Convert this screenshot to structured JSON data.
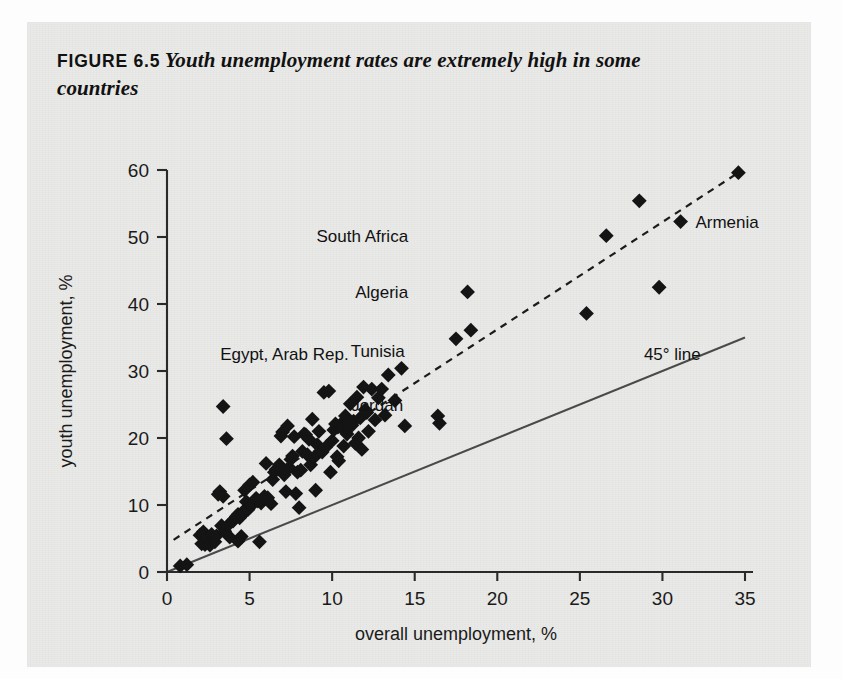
{
  "figure": {
    "tag": "FIGURE 6.5",
    "title": "Youth unemployment rates are extremely high in some countries"
  },
  "chart_data": {
    "type": "scatter",
    "title": "Youth unemployment rates are extremely high in some countries",
    "xlabel": "overall unemployment, %",
    "ylabel": "youth unemployment, %",
    "xlim": [
      0,
      35
    ],
    "ylim": [
      0,
      60
    ],
    "xticks": [
      0,
      5,
      10,
      15,
      20,
      25,
      30,
      35
    ],
    "yticks": [
      0,
      10,
      20,
      30,
      40,
      50,
      60
    ],
    "grid": false,
    "legend": "none",
    "reference_lines": [
      {
        "name": "45-degree-line",
        "label": "45° line",
        "style": "solid",
        "from": [
          0,
          0
        ],
        "to": [
          35,
          35
        ],
        "label_xy": [
          30.6,
          32.5
        ]
      },
      {
        "name": "trend-line",
        "label": "",
        "style": "dashed",
        "from": [
          0.4,
          4.8
        ],
        "to": [
          34.6,
          59.6
        ]
      }
    ],
    "annotations": [
      {
        "text": "South Africa",
        "x": 14.6,
        "y": 50.2,
        "anchor": "end",
        "point": [
          26.6,
          50.2
        ]
      },
      {
        "text": "Armenia",
        "x": 32.0,
        "y": 52.3,
        "anchor": "start",
        "point": [
          31.1,
          52.3
        ]
      },
      {
        "text": "Algeria",
        "x": 14.6,
        "y": 41.8,
        "anchor": "end",
        "point": [
          18.2,
          41.8
        ]
      },
      {
        "text": "Tunisia",
        "x": 14.4,
        "y": 33.0,
        "anchor": "end",
        "point": [
          17.5,
          34.8
        ]
      },
      {
        "text": "Egypt, Arab Rep.",
        "x": 11.0,
        "y": 32.6,
        "anchor": "end",
        "point": [
          9.8,
          27.0
        ]
      },
      {
        "text": "Jordan",
        "x": 14.3,
        "y": 25.0,
        "anchor": "end",
        "point": [
          16.5,
          22.9
        ]
      },
      {
        "text": "45° line",
        "x": 30.6,
        "y": 32.5,
        "anchor": "middle",
        "point": [
          32.5,
          30.0
        ]
      }
    ],
    "points": [
      [
        0.8,
        0.9
      ],
      [
        1.2,
        1.1
      ],
      [
        2.0,
        5.5
      ],
      [
        2.1,
        4.2
      ],
      [
        2.3,
        4.1
      ],
      [
        2.2,
        6.0
      ],
      [
        2.5,
        5.1
      ],
      [
        2.6,
        4.0
      ],
      [
        2.7,
        5.6
      ],
      [
        2.9,
        4.5
      ],
      [
        3.0,
        5.4
      ],
      [
        3.1,
        11.6
      ],
      [
        3.2,
        12.0
      ],
      [
        3.4,
        11.3
      ],
      [
        3.4,
        24.7
      ],
      [
        3.6,
        19.9
      ],
      [
        3.3,
        6.9
      ],
      [
        3.5,
        6.1
      ],
      [
        3.7,
        7.0
      ],
      [
        3.8,
        5.2
      ],
      [
        4.0,
        7.6
      ],
      [
        4.1,
        8.0
      ],
      [
        4.2,
        8.3
      ],
      [
        4.3,
        8.6
      ],
      [
        4.4,
        8.1
      ],
      [
        4.5,
        8.4
      ],
      [
        4.6,
        9.0
      ],
      [
        4.7,
        12.2
      ],
      [
        4.8,
        10.5
      ],
      [
        4.9,
        9.3
      ],
      [
        4.5,
        5.3
      ],
      [
        4.3,
        4.6
      ],
      [
        5.0,
        13.0
      ],
      [
        5.1,
        9.9
      ],
      [
        5.2,
        13.4
      ],
      [
        5.4,
        11.0
      ],
      [
        5.5,
        10.6
      ],
      [
        5.6,
        4.5
      ],
      [
        5.7,
        10.3
      ],
      [
        5.9,
        11.3
      ],
      [
        6.0,
        16.2
      ],
      [
        6.1,
        11.1
      ],
      [
        6.3,
        10.2
      ],
      [
        6.4,
        13.8
      ],
      [
        6.5,
        14.9
      ],
      [
        6.6,
        15.3
      ],
      [
        6.8,
        16.0
      ],
      [
        6.9,
        20.3
      ],
      [
        7.0,
        20.9
      ],
      [
        7.1,
        14.5
      ],
      [
        7.2,
        12.0
      ],
      [
        7.3,
        21.8
      ],
      [
        7.4,
        15.6
      ],
      [
        7.5,
        16.8
      ],
      [
        7.6,
        17.3
      ],
      [
        7.7,
        20.2
      ],
      [
        7.8,
        11.7
      ],
      [
        7.9,
        14.9
      ],
      [
        8.0,
        9.6
      ],
      [
        8.1,
        15.2
      ],
      [
        8.2,
        18.0
      ],
      [
        8.3,
        20.6
      ],
      [
        8.4,
        20.5
      ],
      [
        8.5,
        17.5
      ],
      [
        8.6,
        19.8
      ],
      [
        8.7,
        16.0
      ],
      [
        8.8,
        22.8
      ],
      [
        8.9,
        17.1
      ],
      [
        9.0,
        12.2
      ],
      [
        9.1,
        19.0
      ],
      [
        9.2,
        21.0
      ],
      [
        9.3,
        18.1
      ],
      [
        9.4,
        17.9
      ],
      [
        9.5,
        26.8
      ],
      [
        9.6,
        18.6
      ],
      [
        9.8,
        27.0
      ],
      [
        9.9,
        14.9
      ],
      [
        10.0,
        19.6
      ],
      [
        10.1,
        21.2
      ],
      [
        10.2,
        22.1
      ],
      [
        10.3,
        17.2
      ],
      [
        10.4,
        16.6
      ],
      [
        10.5,
        22.0
      ],
      [
        10.6,
        21.5
      ],
      [
        10.7,
        18.8
      ],
      [
        10.8,
        23.3
      ],
      [
        10.9,
        20.6
      ],
      [
        11.0,
        22.3
      ],
      [
        11.1,
        25.1
      ],
      [
        11.2,
        21.9
      ],
      [
        11.3,
        22.5
      ],
      [
        11.4,
        19.2
      ],
      [
        11.5,
        26.1
      ],
      [
        11.6,
        20.0
      ],
      [
        11.7,
        23.0
      ],
      [
        11.8,
        18.3
      ],
      [
        11.9,
        27.6
      ],
      [
        12.0,
        24.2
      ],
      [
        12.1,
        23.8
      ],
      [
        12.2,
        21.0
      ],
      [
        12.4,
        27.3
      ],
      [
        12.6,
        22.7
      ],
      [
        12.8,
        26.0
      ],
      [
        13.0,
        27.3
      ],
      [
        13.2,
        23.4
      ],
      [
        13.4,
        29.4
      ],
      [
        13.8,
        25.6
      ],
      [
        14.2,
        30.4
      ],
      [
        14.4,
        21.8
      ],
      [
        16.4,
        23.3
      ],
      [
        16.5,
        22.2
      ],
      [
        17.5,
        34.8
      ],
      [
        18.4,
        36.1
      ],
      [
        18.2,
        41.8
      ],
      [
        25.4,
        38.6
      ],
      [
        26.6,
        50.2
      ],
      [
        28.6,
        55.4
      ],
      [
        29.8,
        42.5
      ],
      [
        31.1,
        52.3
      ],
      [
        34.6,
        59.6
      ]
    ]
  }
}
